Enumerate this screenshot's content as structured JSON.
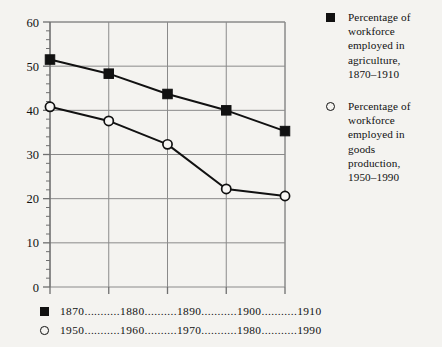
{
  "chart_data": {
    "type": "line",
    "title": "",
    "subtitle": "",
    "xlabel": "",
    "ylabel": "",
    "ylim": [
      0,
      60
    ],
    "ytick_values": [
      0,
      10,
      20,
      30,
      40,
      50,
      60
    ],
    "ytick_labels": [
      "0",
      "10",
      "20",
      "30",
      "40",
      "50",
      "60"
    ],
    "yminor_step": 2,
    "grid": true,
    "grid_vertical": true,
    "grid_horizontal": true,
    "legend_position": "right",
    "x_index": [
      0,
      1,
      2,
      3,
      4
    ],
    "series": [
      {
        "name": "Percentage of workforce employed in agriculture, 1870–1910",
        "marker": "filled-square",
        "categories": [
          "1870",
          "1880",
          "1890",
          "1900",
          "1910"
        ],
        "values": [
          51.5,
          48.3,
          43.7,
          40.0,
          35.3
        ]
      },
      {
        "name": "Percentage of workforce employed in goods production, 1950–1990",
        "marker": "open-circle",
        "categories": [
          "1950",
          "1960",
          "1970",
          "1980",
          "1990"
        ],
        "values": [
          40.8,
          37.6,
          32.3,
          22.2,
          20.6
        ]
      }
    ],
    "colors": {
      "line": "#111111",
      "marker_fill": "#111111",
      "marker_open_fill": "#f8f7f5",
      "grid": "#8a8a8a",
      "axis": "#6f6f6f",
      "background": "#f4f3f0"
    }
  },
  "legend": {
    "entries": [
      {
        "marker": "filled-square",
        "label": "Percentage of\nworkforce\nemployed in\nagriculture,\n1870–1910"
      },
      {
        "marker": "open-circle",
        "label": "Percentage of\nworkforce\nemployed in\ngoods\nproduction,\n1950–1990"
      }
    ]
  },
  "axis_rows": [
    {
      "marker": "filled-square",
      "text": "1870...........1880..........1890...........1900...........1910"
    },
    {
      "marker": "open-circle",
      "text": "1950...........1960..........1970...........1980...........1990"
    }
  ]
}
